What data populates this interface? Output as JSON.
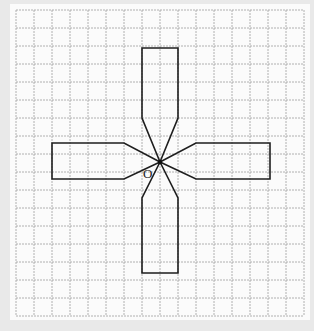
{
  "diagram": {
    "grid": {
      "columns": 16,
      "rows": 17,
      "cell_px": 18,
      "origin_px": [
        16,
        10
      ],
      "line_color": "#9a9a9a"
    },
    "center_label": "O",
    "center_px": [
      160,
      162
    ],
    "shape_color": "#1e1e1e"
  }
}
